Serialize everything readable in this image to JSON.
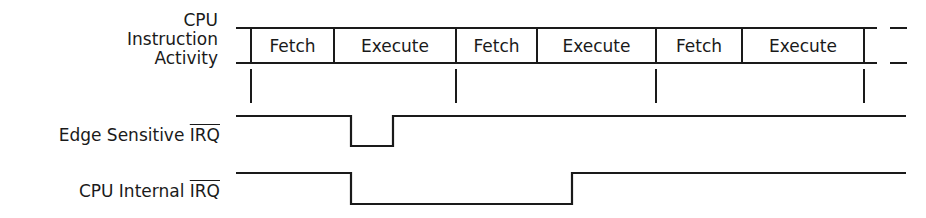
{
  "diagram": {
    "type": "timing-diagram",
    "signals": [
      {
        "id": "cpu",
        "label_lines": [
          "CPU",
          "Instruction",
          "Activity"
        ]
      },
      {
        "id": "edge",
        "label_prefix": "Edge Sensitive ",
        "label_overline": "IRQ"
      },
      {
        "id": "internal",
        "label_prefix": "CPU Internal ",
        "label_overline": "IRQ"
      }
    ],
    "cpu_activity": {
      "cells": [
        {
          "label": "Fetch",
          "x0": 251,
          "x1": 334
        },
        {
          "label": "Execute",
          "x0": 334,
          "x1": 456
        },
        {
          "label": "Fetch",
          "x0": 456,
          "x1": 537
        },
        {
          "label": "Execute",
          "x0": 537,
          "x1": 656
        },
        {
          "label": "Fetch",
          "x0": 656,
          "x1": 742
        },
        {
          "label": "Execute",
          "x0": 742,
          "x1": 864
        }
      ],
      "cycle_markers_x": [
        251,
        456,
        656,
        864
      ]
    },
    "edge_irq": {
      "high_y": 116,
      "low_y": 146,
      "fall_x": 351,
      "rise_x": 393
    },
    "internal_irq": {
      "high_y": 173,
      "low_y": 204,
      "fall_x": 351,
      "rise_x": 572
    },
    "line_color": "#1a1a1a"
  }
}
